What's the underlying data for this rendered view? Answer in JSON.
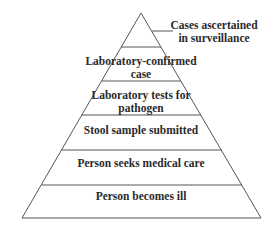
{
  "diagram": {
    "type": "surveillance-pyramid",
    "colors": {
      "line": "#555555",
      "text": "#2a2a2a",
      "background": "#ffffff"
    },
    "apex_label": {
      "line1": "Cases ascertained",
      "line2": "in surveillance"
    },
    "layers": [
      {
        "line1": "Laboratory-confirmed",
        "line2": "case"
      },
      {
        "line1": "Laboratory tests for",
        "line2": "pathogen"
      },
      {
        "line1": "Stool sample submitted"
      },
      {
        "line1": "Person seeks medical care"
      },
      {
        "line1": "Person becomes ill"
      }
    ]
  }
}
